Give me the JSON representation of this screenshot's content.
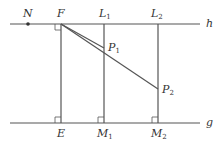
{
  "diagram": {
    "type": "geometry",
    "colors": {
      "stroke": "#555555",
      "text": "#333333",
      "background": "#ffffff"
    },
    "lines": {
      "h": {
        "label": "h",
        "y": 24,
        "x1": 10,
        "x2": 200
      },
      "g": {
        "label": "g",
        "y": 123,
        "x1": 10,
        "x2": 200
      }
    },
    "points": {
      "N": {
        "label": "N",
        "x": 28,
        "y": 24
      },
      "F": {
        "label": "F",
        "x": 61,
        "y": 24
      },
      "L1": {
        "label": "L",
        "sub": "1",
        "x": 104,
        "y": 24
      },
      "L2": {
        "label": "L",
        "sub": "2",
        "x": 158,
        "y": 24
      },
      "E": {
        "label": "E",
        "x": 61,
        "y": 123
      },
      "M1": {
        "label": "M",
        "sub": "1",
        "x": 104,
        "y": 123
      },
      "M2": {
        "label": "M",
        "sub": "2",
        "x": 158,
        "y": 123
      },
      "P1": {
        "label": "P",
        "sub": "1",
        "x": 104,
        "y": 48
      },
      "P2": {
        "label": "P",
        "sub": "2",
        "x": 158,
        "y": 89
      }
    },
    "segments": [
      "FE",
      "L1M1",
      "L2M2",
      "FP1",
      "FP2"
    ],
    "right_angles": [
      "F",
      "E",
      "M1",
      "M2"
    ]
  }
}
